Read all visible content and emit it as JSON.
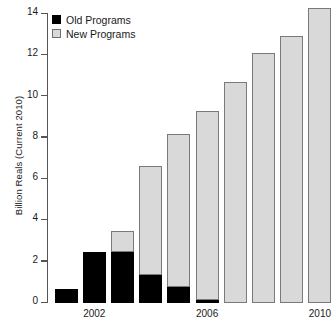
{
  "chart_data": {
    "type": "bar",
    "subtype": "stacked-bar",
    "title": "",
    "subtitle": "",
    "xlabel": "",
    "ylabel": "Billion Reals (Current 2010)",
    "ylim": [
      0,
      14
    ],
    "yticks": [
      0,
      2,
      4,
      6,
      8,
      10,
      12,
      14
    ],
    "ytick_labels": [
      "0",
      "2",
      "4",
      "6",
      "8",
      "10",
      "12",
      "14"
    ],
    "grid": false,
    "legend_position": "top-left",
    "categories": [
      "2001",
      "2002",
      "2003",
      "2004",
      "2005",
      "2006",
      "2007",
      "2008",
      "2009",
      "2010"
    ],
    "xtick_labels": [
      "2002",
      "2006",
      "2010"
    ],
    "xtick_categories": [
      "2002",
      "2006",
      "2010"
    ],
    "series": [
      {
        "name": "Old Programs",
        "color": "#000000",
        "values": [
          0.68,
          2.48,
          2.48,
          1.35,
          0.78,
          0.15,
          0.0,
          0.0,
          0.0,
          0.0
        ]
      },
      {
        "name": "New Programs",
        "color": "#d9d9d9",
        "values": [
          0.0,
          0.0,
          1.02,
          5.3,
          7.42,
          9.15,
          10.7,
          12.1,
          12.95,
          14.3
        ]
      }
    ],
    "totals": [
      0.68,
      2.48,
      3.5,
      6.65,
      8.2,
      9.3,
      10.7,
      12.1,
      12.95,
      14.3
    ]
  },
  "legend": {
    "entries": [
      {
        "label": "Old Programs",
        "swatch": "legend-swatch-black"
      },
      {
        "label": "New Programs",
        "swatch": "legend-swatch-gray"
      }
    ]
  },
  "axes": {
    "y_title": "Billion Reals (Current 2010)"
  }
}
